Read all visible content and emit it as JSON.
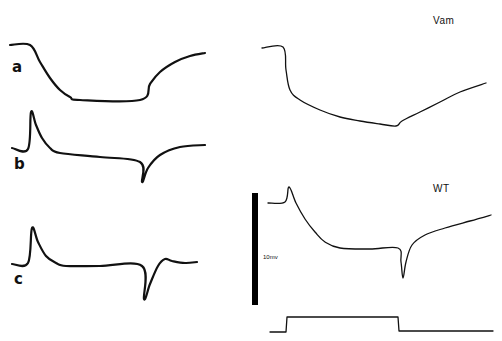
{
  "figure": {
    "panels": [
      {
        "id": "a",
        "label": "a"
      },
      {
        "id": "b",
        "label": "b"
      },
      {
        "id": "c",
        "label": "c"
      }
    ],
    "conditions": {
      "vam": "Vam",
      "wt": "WT"
    },
    "scale_bar": {
      "label": "10mv"
    }
  },
  "chart_data": {
    "type": "line",
    "title": "",
    "xlabel": "",
    "ylabel": "",
    "series": [
      {
        "name": "a",
        "points": [
          [
            10,
            45
          ],
          [
            30,
            45
          ],
          [
            40,
            62
          ],
          [
            50,
            78
          ],
          [
            60,
            90
          ],
          [
            70,
            97
          ],
          [
            80,
            100
          ],
          [
            140,
            100
          ],
          [
            150,
            84
          ],
          [
            160,
            72
          ],
          [
            175,
            62
          ],
          [
            190,
            56
          ],
          [
            205,
            53
          ]
        ]
      },
      {
        "name": "b",
        "points": [
          [
            12,
            148
          ],
          [
            28,
            149
          ],
          [
            31,
            112
          ],
          [
            36,
            125
          ],
          [
            42,
            138
          ],
          [
            50,
            148
          ],
          [
            60,
            153
          ],
          [
            100,
            157
          ],
          [
            140,
            162
          ],
          [
            142,
            182
          ],
          [
            148,
            168
          ],
          [
            160,
            155
          ],
          [
            180,
            147
          ],
          [
            205,
            145
          ]
        ]
      },
      {
        "name": "c",
        "points": [
          [
            12,
            264
          ],
          [
            28,
            263
          ],
          [
            32,
            228
          ],
          [
            38,
            242
          ],
          [
            46,
            256
          ],
          [
            56,
            263
          ],
          [
            66,
            266
          ],
          [
            100,
            266
          ],
          [
            142,
            266
          ],
          [
            144,
            299
          ],
          [
            150,
            284
          ],
          [
            158,
            266
          ],
          [
            165,
            259
          ],
          [
            172,
            261
          ],
          [
            185,
            263
          ],
          [
            197,
            262
          ]
        ]
      },
      {
        "name": "Vam",
        "points": [
          [
            262,
            48
          ],
          [
            283,
            47
          ],
          [
            286,
            70
          ],
          [
            290,
            90
          ],
          [
            300,
            100
          ],
          [
            320,
            110
          ],
          [
            340,
            117
          ],
          [
            360,
            121
          ],
          [
            380,
            124
          ],
          [
            396,
            126
          ],
          [
            402,
            121
          ],
          [
            420,
            112
          ],
          [
            440,
            102
          ],
          [
            460,
            92
          ],
          [
            486,
            83
          ]
        ]
      },
      {
        "name": "WT",
        "points": [
          [
            268,
            203
          ],
          [
            285,
            202
          ],
          [
            289,
            187
          ],
          [
            296,
            203
          ],
          [
            305,
            219
          ],
          [
            315,
            232
          ],
          [
            325,
            242
          ],
          [
            340,
            248
          ],
          [
            370,
            249
          ],
          [
            398,
            248
          ],
          [
            401,
            262
          ],
          [
            403,
            278
          ],
          [
            406,
            262
          ],
          [
            412,
            245
          ],
          [
            425,
            235
          ],
          [
            445,
            228
          ],
          [
            470,
            221
          ],
          [
            491,
            215
          ]
        ]
      },
      {
        "name": "stimulus",
        "points": [
          [
            270,
            332
          ],
          [
            286,
            332
          ],
          [
            287,
            317
          ],
          [
            398,
            317
          ],
          [
            399,
            331
          ],
          [
            493,
            331
          ]
        ]
      }
    ],
    "annotations": [
      "a",
      "b",
      "c",
      "Vam",
      "WT",
      "10mv"
    ]
  }
}
